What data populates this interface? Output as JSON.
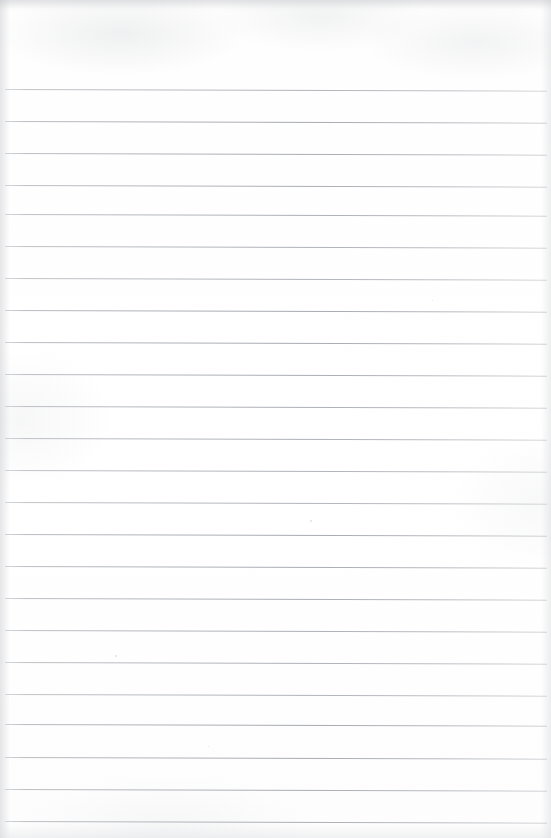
{
  "document": {
    "kind": "scanned-lined-paper",
    "title": "Blank Ruled Notepaper",
    "page_width": 551,
    "page_height": 838,
    "orientation": "portrait",
    "content_text": "",
    "has_handwriting": false,
    "has_printed_text": false
  },
  "paper": {
    "background_color": "#fefefe",
    "edge_shadow_color": "#bec0c4",
    "top_margin_px": 88,
    "bottom_margin_px": 17,
    "left_margin_px": 5,
    "right_margin_px": 4
  },
  "ruling": {
    "style": "wide-ruled",
    "line_color": "#a8abb1",
    "line_thickness_px": 1,
    "line_spacing_px": 31.8,
    "line_count": 24,
    "skew_degrees": 0.18,
    "line_start_x": 5,
    "line_end_x": 547,
    "line_positions_y": [
      89,
      121,
      153,
      185,
      214,
      246,
      278,
      310,
      342,
      374,
      406,
      438,
      470,
      502,
      534,
      566,
      598,
      630,
      662,
      694,
      724,
      757,
      789,
      821
    ]
  },
  "artifacts": {
    "specks": [
      {
        "x": 115,
        "y": 655,
        "size": 2
      },
      {
        "x": 310,
        "y": 520,
        "size": 2
      },
      {
        "x": 432,
        "y": 300,
        "size": 1
      },
      {
        "x": 208,
        "y": 746,
        "size": 1
      }
    ]
  }
}
